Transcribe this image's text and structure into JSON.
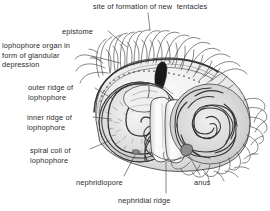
{
  "figure": {
    "width": 270,
    "height": 211,
    "background_color": "#ffffff",
    "ink_color": "#2b2b2b"
  },
  "labels": [
    {
      "id": "site-of-formation",
      "text": "site of formation of new  tentacles",
      "x": 93,
      "y": 2,
      "align": "left",
      "leader": [
        [
          148,
          13
        ],
        [
          150,
          27
        ]
      ]
    },
    {
      "id": "epistome",
      "text": "epistome",
      "x": 62,
      "y": 27,
      "align": "left",
      "leader": [
        [
          108,
          31
        ],
        [
          126,
          46
        ]
      ]
    },
    {
      "id": "lophophore-organ",
      "text": "lophophore organ in\nform of glandular\ndepression",
      "x": 2,
      "y": 41,
      "align": "left",
      "leader": [
        [
          92,
          55
        ],
        [
          119,
          62
        ]
      ]
    },
    {
      "id": "outer-ridge",
      "text": "outer ridge of\nlophophore",
      "x": 28,
      "y": 83,
      "align": "left",
      "leader": [
        [
          94,
          88
        ],
        [
          112,
          98
        ]
      ]
    },
    {
      "id": "inner-ridge",
      "text": "inner ridge of\nlophophore",
      "x": 27,
      "y": 113,
      "align": "left",
      "leader": [
        [
          93,
          117
        ],
        [
          110,
          119
        ]
      ]
    },
    {
      "id": "spiral-coil",
      "text": "spiral coil of\nlophophore",
      "x": 30,
      "y": 146,
      "align": "left",
      "leader": [
        [
          89,
          149
        ],
        [
          108,
          142
        ]
      ]
    },
    {
      "id": "nephridiopore",
      "text": "nephridiopore",
      "x": 76,
      "y": 178,
      "align": "left",
      "leader": [
        [
          124,
          177
        ],
        [
          134,
          155
        ]
      ]
    },
    {
      "id": "nephridial-ridge",
      "text": "nephridial ridge",
      "x": 118,
      "y": 196,
      "align": "left",
      "leader": [
        [
          166,
          194
        ],
        [
          166,
          162
        ]
      ]
    },
    {
      "id": "anus",
      "text": "anus",
      "x": 194,
      "y": 178,
      "align": "left",
      "leader": [
        [
          200,
          177
        ],
        [
          188,
          154
        ]
      ]
    }
  ],
  "structures": {
    "tentacle_crown": "row of wavy tentacles arching over the upper margin",
    "outer_ridge_band": "beaded crescent band along the upper left rim",
    "left_spiral": "tightly wound spiral coil of the lophophore, left side",
    "right_spiral": "dense spiral whorl of coiled tentacles, right side",
    "nephridial_lobes": "pair of smooth rounded lobes at lower centre",
    "glandular_spot": "dark teardrop marking the glandular depression"
  }
}
